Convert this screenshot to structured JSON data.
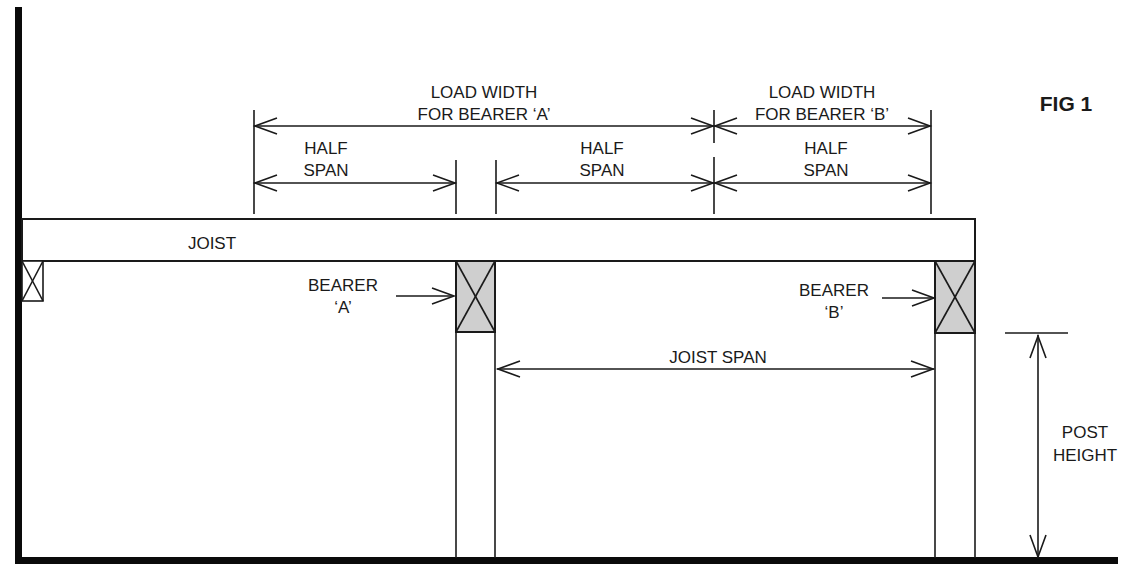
{
  "figure": {
    "title": "FIG 1",
    "labels": {
      "load_width_a": [
        "LOAD WIDTH",
        "FOR BEARER ‘A’"
      ],
      "load_width_b": [
        "LOAD WIDTH",
        "FOR BEARER ‘B’"
      ],
      "half_span_1": [
        "HALF",
        "SPAN"
      ],
      "half_span_2": [
        "HALF",
        "SPAN"
      ],
      "half_span_3": [
        "HALF",
        "SPAN"
      ],
      "joist": "JOIST",
      "bearer_a": [
        "BEARER",
        "‘A’"
      ],
      "bearer_b": [
        "BEARER",
        "‘B’"
      ],
      "joist_span": "JOIST SPAN",
      "post_height": [
        "POST",
        "HEIGHT"
      ]
    },
    "colors": {
      "line": "#1a1a1a",
      "bearer_fill": "#cfcfcf",
      "background": "#ffffff"
    }
  }
}
